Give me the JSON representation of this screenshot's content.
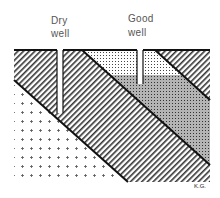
{
  "labels": {
    "dry_well_line1": "Dry",
    "dry_well_line2": "well",
    "good_well_line1": "Good",
    "good_well_line2": "well",
    "signature": "K.G."
  },
  "colors": {
    "line": "#111111",
    "shale_stripe": "#333333",
    "sand_dot": "#444444",
    "water": "#b0b0b0",
    "cross": "#555555"
  },
  "layers": [
    {
      "name": "crystalline-basement",
      "pattern": "crosses"
    },
    {
      "name": "shale-lower",
      "pattern": "diagonal-stripes"
    },
    {
      "name": "sandstone-aquifer-dry",
      "pattern": "dots"
    },
    {
      "name": "sandstone-aquifer-saturated",
      "pattern": "dots-on-gray"
    },
    {
      "name": "shale-upper",
      "pattern": "diagonal-stripes"
    }
  ]
}
